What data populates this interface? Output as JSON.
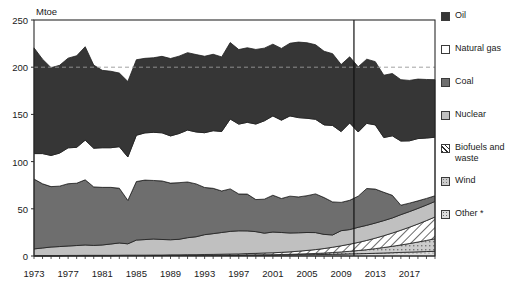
{
  "chart_data": {
    "type": "area",
    "title": "",
    "subtitle": "",
    "xlabel": "",
    "ylabel": "Mtoe",
    "unit": "Mtoe",
    "stacked": true,
    "grid": false,
    "legend_position": "right",
    "xlim": [
      1973,
      2020
    ],
    "ylim": [
      0,
      250
    ],
    "yticks": [
      0,
      50,
      100,
      150,
      200,
      250
    ],
    "xticks": [
      1973,
      1977,
      1981,
      1985,
      1989,
      1993,
      1997,
      2001,
      2005,
      2009,
      2013,
      2017
    ],
    "x": [
      1973,
      1974,
      1975,
      1976,
      1977,
      1978,
      1979,
      1980,
      1981,
      1982,
      1983,
      1984,
      1985,
      1986,
      1987,
      1988,
      1989,
      1990,
      1991,
      1992,
      1993,
      1994,
      1995,
      1996,
      1997,
      1998,
      1999,
      2000,
      2001,
      2002,
      2003,
      2004,
      2005,
      2006,
      2007,
      2008,
      2009,
      2010,
      2011,
      2012,
      2013,
      2014,
      2015,
      2016,
      2017,
      2018,
      2019,
      2020
    ],
    "annotations": [
      {
        "name": "projection-divider",
        "type": "vline",
        "x": 2010.5,
        "label": ""
      },
      {
        "name": "reference-line-200",
        "type": "hline",
        "y": 200,
        "style": "dashed",
        "label": ""
      }
    ],
    "footnote": "*",
    "series": [
      {
        "name": "Other *",
        "order": 1,
        "fill": "#d8d8d8",
        "pattern": "dots",
        "values": [
          0.3,
          0.3,
          0.3,
          0.3,
          0.4,
          0.4,
          0.4,
          0.4,
          0.4,
          0.4,
          0.5,
          0.5,
          0.5,
          0.5,
          0.5,
          0.5,
          0.6,
          0.6,
          0.6,
          0.6,
          0.7,
          0.7,
          0.7,
          0.8,
          0.8,
          0.9,
          0.9,
          1.0,
          1.0,
          1.1,
          1.2,
          1.3,
          1.4,
          1.5,
          1.6,
          1.8,
          2.0,
          2.2,
          2.4,
          2.6,
          2.9,
          3.2,
          3.5,
          3.8,
          4.1,
          4.4,
          4.7,
          5.0
        ]
      },
      {
        "name": "Wind",
        "order": 2,
        "fill": "#c9c9c9",
        "pattern": "small-square",
        "values": [
          0.0,
          0.0,
          0.0,
          0.0,
          0.0,
          0.0,
          0.0,
          0.0,
          0.0,
          0.0,
          0.0,
          0.0,
          0.0,
          0.0,
          0.0,
          0.0,
          0.0,
          0.0,
          0.1,
          0.1,
          0.1,
          0.1,
          0.2,
          0.2,
          0.2,
          0.3,
          0.3,
          0.4,
          0.4,
          0.5,
          0.6,
          0.8,
          1.0,
          1.2,
          1.5,
          1.9,
          2.3,
          2.8,
          3.4,
          4.1,
          4.9,
          5.8,
          6.8,
          7.9,
          9.1,
          10.4,
          11.8,
          13.3
        ]
      },
      {
        "name": "Biofuels and waste",
        "order": 3,
        "fill": "#ffffff",
        "pattern": "hatch",
        "values": [
          0.2,
          0.2,
          0.2,
          0.2,
          0.2,
          0.2,
          0.3,
          0.3,
          0.3,
          0.3,
          0.3,
          0.4,
          0.4,
          0.4,
          0.5,
          0.5,
          0.6,
          0.6,
          0.7,
          0.7,
          0.8,
          0.9,
          1.0,
          1.1,
          1.2,
          1.4,
          1.6,
          1.8,
          2.0,
          2.3,
          2.6,
          3.0,
          3.5,
          4.1,
          4.8,
          5.6,
          6.5,
          7.5,
          8.6,
          9.8,
          11.1,
          12.5,
          14.0,
          15.6,
          17.3,
          19.1,
          21.0,
          23.0
        ]
      },
      {
        "name": "Nuclear",
        "order": 4,
        "fill": "#c0c0c0",
        "pattern": "solid",
        "values": [
          7.0,
          8.0,
          9.0,
          9.5,
          10.0,
          10.5,
          11.0,
          10.5,
          11.0,
          12.0,
          13.0,
          12.0,
          16.0,
          16.5,
          17.0,
          16.5,
          16.0,
          16.5,
          18.0,
          19.0,
          21.0,
          22.0,
          23.0,
          24.0,
          24.5,
          24.0,
          23.0,
          21.0,
          22.0,
          21.0,
          20.0,
          19.5,
          19.0,
          18.0,
          15.0,
          13.0,
          16.0,
          15.5,
          16.0,
          16.0,
          16.0,
          16.0,
          16.0,
          16.5,
          16.5,
          16.5,
          16.5,
          16.5
        ]
      },
      {
        "name": "Coal",
        "order": 5,
        "fill": "#6e6e6e",
        "pattern": "solid",
        "values": [
          74.0,
          68.0,
          64.0,
          64.0,
          66.0,
          66.0,
          69.0,
          62.0,
          61.0,
          60.0,
          58.0,
          46.0,
          62.0,
          63.0,
          62.0,
          62.0,
          60.0,
          60.0,
          59.0,
          56.0,
          50.0,
          48.0,
          44.0,
          45.0,
          39.0,
          39.0,
          34.0,
          36.0,
          39.0,
          36.0,
          39.0,
          38.0,
          39.0,
          41.0,
          39.0,
          35.0,
          30.0,
          31.0,
          33.0,
          39.0,
          36.0,
          30.0,
          24.0,
          10.0,
          9.0,
          8.0,
          7.0,
          6.0
        ]
      },
      {
        "name": "Natural gas",
        "order": 6,
        "fill": "#ffffff",
        "pattern": "solid",
        "values": [
          27.0,
          32.0,
          33.0,
          35.0,
          38.0,
          38.0,
          42.0,
          41.0,
          42.0,
          42.0,
          44.0,
          46.0,
          49.0,
          50.0,
          51.0,
          51.0,
          50.0,
          52.0,
          55.0,
          55.0,
          58.0,
          61.0,
          63.0,
          74.0,
          74.0,
          76.0,
          80.0,
          83.0,
          84.0,
          83.0,
          85.0,
          84.0,
          82.0,
          79.0,
          77.0,
          81.0,
          75.0,
          82.0,
          68.0,
          69.0,
          68.0,
          58.0,
          63.0,
          68.0,
          66.0,
          66.0,
          64.0,
          62.0
        ]
      },
      {
        "name": "Oil",
        "order": 7,
        "fill": "#363636",
        "pattern": "solid",
        "values": [
          112.0,
          100.0,
          93.0,
          93.0,
          95.0,
          97.0,
          99.0,
          88.0,
          82.0,
          81.0,
          78.0,
          80.0,
          80.0,
          79.0,
          79.0,
          81.0,
          82.0,
          82.0,
          82.0,
          82.0,
          81.0,
          81.0,
          79.0,
          81.0,
          79.0,
          79.0,
          79.0,
          77.0,
          76.0,
          76.0,
          77.0,
          80.0,
          80.0,
          79.0,
          78.0,
          76.0,
          71.0,
          70.0,
          69.0,
          68.0,
          67.0,
          66.0,
          66.0,
          65.0,
          64.0,
          63.0,
          62.0,
          61.0
        ]
      }
    ]
  },
  "legend": {
    "items": [
      {
        "label": "Oil",
        "swatch": "oil-swatch"
      },
      {
        "label": "Natural gas",
        "swatch": "natural-gas-swatch"
      },
      {
        "label": "Coal",
        "swatch": "coal-swatch"
      },
      {
        "label": "Nuclear",
        "swatch": "nuclear-swatch"
      },
      {
        "label": "Biofuels and\nwaste",
        "swatch": "biofuels-swatch"
      },
      {
        "label": "Wind",
        "swatch": "wind-swatch"
      },
      {
        "label": "Other *",
        "swatch": "other-swatch"
      }
    ]
  }
}
